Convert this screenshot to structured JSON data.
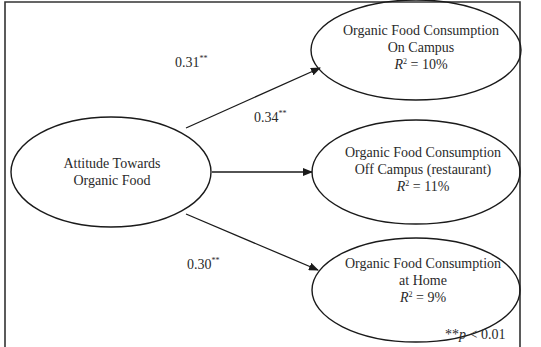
{
  "diagram": {
    "type": "path-model",
    "colors": {
      "stroke": "#1a1a1a",
      "text": "#2a2a2a",
      "background": "#ffffff"
    },
    "nodes": {
      "predictor": {
        "line1": "Attitude Towards",
        "line2": "Organic Food"
      },
      "on_campus": {
        "line1": "Organic Food Consumption",
        "line2": "On Campus",
        "r2_label": "R",
        "r2_sup": "2",
        "r2_value": " = 10%"
      },
      "off_campus": {
        "line1": "Organic Food Consumption",
        "line2": "Off Campus (restaurant)",
        "r2_label": "R",
        "r2_sup": "2",
        "r2_value": " = 11%"
      },
      "home": {
        "line1": "Organic Food Consumption",
        "line2": "at Home",
        "r2_label": "R",
        "r2_sup": "2",
        "r2_value": " = 9%"
      }
    },
    "paths": [
      {
        "from": "predictor",
        "to": "on_campus",
        "coefficient": "0.31",
        "sig": "**"
      },
      {
        "from": "predictor",
        "to": "off_campus",
        "coefficient": "0.34",
        "sig": "**"
      },
      {
        "from": "predictor",
        "to": "home",
        "coefficient": "0.30",
        "sig": "**"
      }
    ],
    "note": {
      "stars": "**",
      "p": "p",
      "rest": " < 0.01"
    }
  }
}
